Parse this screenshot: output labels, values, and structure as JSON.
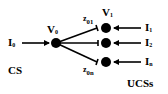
{
  "diagram": {
    "type": "star-network",
    "central_node": {
      "label": "V",
      "subscript": "0",
      "input": {
        "label": "I",
        "subscript": "0"
      },
      "group": "CS"
    },
    "edges": [
      {
        "label": "z",
        "subscript": "01"
      },
      {
        "label": "z",
        "subscript": "0n"
      }
    ],
    "peripheral_nodes": [
      {
        "label": "V",
        "subscript": "1",
        "input": {
          "label": "I",
          "subscript": "1"
        }
      },
      {
        "label": "",
        "subscript": "",
        "input": {
          "label": "I",
          "subscript": "2"
        }
      },
      {
        "label": "",
        "subscript": "",
        "input": {
          "label": "I",
          "subscript": "n"
        }
      }
    ],
    "groups": {
      "left": "CS",
      "right": "UCSs"
    }
  }
}
